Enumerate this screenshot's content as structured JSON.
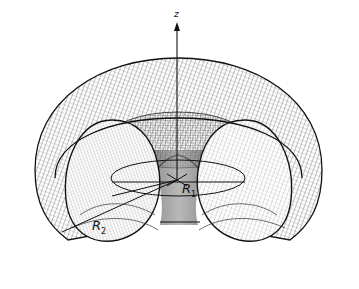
{
  "figure": {
    "axis_label": "z",
    "labels": {
      "r1_main": "R",
      "r1_sub": "1",
      "r2_main": "R",
      "r2_sub": "2"
    },
    "colors": {
      "background": "#ffffff",
      "mesh": "#222222",
      "outline": "#111111",
      "shade": "#9a9a9a"
    }
  }
}
